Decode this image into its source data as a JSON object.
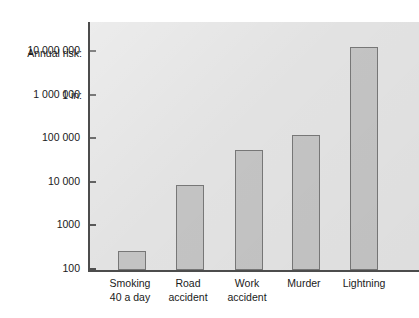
{
  "chart_data": {
    "type": "bar",
    "title": "Annual risk:\n1 in:",
    "title_lines": [
      "Annual risk:",
      "1 in:"
    ],
    "xlabel": "",
    "ylabel": "Annual risk: 1 in:",
    "yscale": "log",
    "ylim": [
      100,
      10000000
    ],
    "grid": false,
    "legend": null,
    "categories": [
      "Smoking 40 a day",
      "Road accident",
      "Work accident",
      "Murder",
      "Lightning"
    ],
    "category_lines": [
      [
        "Smoking",
        "40 a day"
      ],
      [
        "Road",
        "accident"
      ],
      [
        "Work",
        "accident"
      ],
      [
        "Murder"
      ],
      [
        "Lightning"
      ]
    ],
    "values": [
      250,
      8000,
      50000,
      110000,
      12000000
    ],
    "ytick_labels": [
      "10 000 000",
      "1 000 000",
      "100 000",
      "10 000",
      "1000",
      "100"
    ],
    "ytick_values": [
      10000000,
      1000000,
      100000,
      10000,
      1000,
      100
    ],
    "colors": {
      "bar_fill": "#c3c3c3",
      "bar_stroke": "#777777",
      "plot_background": "#e2e2e2",
      "axis": "#4c4c4c",
      "text": "#1a1a1a",
      "page_background": "#ffffff"
    }
  }
}
